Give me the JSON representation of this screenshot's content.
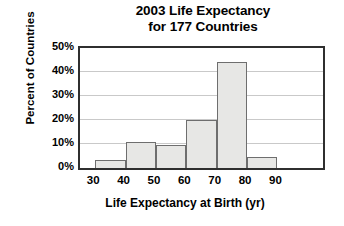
{
  "chart_data": {
    "type": "bar",
    "title": "2003 Life Expectancy for 177 Countries",
    "title_lines": [
      "2003 Life Expectancy",
      "for 177 Countries"
    ],
    "xlabel": "Life Expectancy at Birth (yr)",
    "ylabel": "Percent of Countries",
    "categories": [
      "30-40",
      "40-50",
      "50-60",
      "60-70",
      "70-80",
      "80-90"
    ],
    "bin_edges": [
      30,
      40,
      50,
      60,
      70,
      80,
      90
    ],
    "values": [
      3.5,
      11,
      9.5,
      20,
      44,
      4.5
    ],
    "bars": [
      {
        "bin_start": 30,
        "bin_end": 40,
        "value": 3.5
      },
      {
        "bin_start": 40,
        "bin_end": 50,
        "value": 11
      },
      {
        "bin_start": 50,
        "bin_end": 60,
        "value": 9.5
      },
      {
        "bin_start": 60,
        "bin_end": 70,
        "value": 20
      },
      {
        "bin_start": 70,
        "bin_end": 80,
        "value": 44
      },
      {
        "bin_start": 80,
        "bin_end": 90,
        "value": 4.5
      }
    ],
    "xlim": [
      25,
      105
    ],
    "ylim": [
      0,
      50
    ],
    "xticks": [
      30,
      40,
      50,
      60,
      70,
      80,
      90
    ],
    "xtick_labels": [
      "30",
      "40",
      "50",
      "60",
      "70",
      "80",
      "90"
    ],
    "yticks": [
      0,
      10,
      20,
      30,
      40,
      50
    ],
    "ytick_labels": [
      "0%",
      "10%",
      "20%",
      "30%",
      "40%",
      "50%"
    ],
    "grid": "horizontal",
    "legend": "none",
    "colors": {
      "bar_fill": "#e7e7e5",
      "bar_edge": "#6e6e6e",
      "frame": "#2f2f2f",
      "gridline": "#c9c9c9",
      "text": "#000000",
      "background": "#ffffff"
    }
  }
}
